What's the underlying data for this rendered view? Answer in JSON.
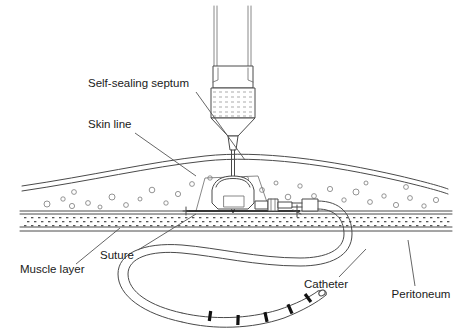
{
  "figure": {
    "background_color": "#ffffff",
    "line_color": "#4a4a4a",
    "text_color": "#1a1a1a",
    "width": 470,
    "height": 331
  },
  "labels": [
    {
      "id": "self-sealing-septum",
      "text": "Self-sealing septum",
      "x": 88,
      "y": 87,
      "anchor": "start",
      "leader": "M 196 92 L 245 160"
    },
    {
      "id": "skin-line",
      "text": "Skin line",
      "x": 88,
      "y": 128,
      "anchor": "start",
      "leader": "M 135 133 L 196 176"
    },
    {
      "id": "suture",
      "text": "Suture",
      "x": 100,
      "y": 259,
      "anchor": "start",
      "leader": "M 138 250 L 196 214"
    },
    {
      "id": "muscle-layer",
      "text": "Muscle layer",
      "x": 20,
      "y": 273,
      "anchor": "start",
      "leader": "M 76 264 L 120 228"
    },
    {
      "id": "catheter",
      "text": "Catheter",
      "x": 326,
      "y": 288,
      "anchor": "middle",
      "leader": "M 339 277 L 366 249"
    },
    {
      "id": "peritoneum",
      "text": "Peritoneum",
      "x": 421,
      "y": 298,
      "anchor": "middle",
      "leader": "M 415 286 L 408 240"
    }
  ],
  "components": [
    {
      "id": "syringe-barrel",
      "name": "syringe barrel"
    },
    {
      "id": "syringe-grip",
      "name": "syringe finger grip"
    },
    {
      "id": "syringe-hatched-chamber",
      "name": "hatched medication chamber"
    },
    {
      "id": "syringe-cone",
      "name": "syringe luer cone"
    },
    {
      "id": "needle-hub",
      "name": "non-coring needle hub"
    },
    {
      "id": "needle-shaft",
      "name": "non-coring needle shaft"
    },
    {
      "id": "skin-surface",
      "name": "skin surface line"
    },
    {
      "id": "subcutaneous-fat",
      "name": "subcutaneous fat layer"
    },
    {
      "id": "muscle-band",
      "name": "muscle layer band"
    },
    {
      "id": "peritoneum-line",
      "name": "peritoneum line"
    },
    {
      "id": "port-body",
      "name": "port reservoir body"
    },
    {
      "id": "port-septum",
      "name": "self-sealing septum"
    },
    {
      "id": "port-baseplate",
      "name": "port base plate"
    },
    {
      "id": "suture-anchor-left",
      "name": "left suture anchor"
    },
    {
      "id": "suture-anchor-right",
      "name": "right suture anchor"
    },
    {
      "id": "catheter-connector",
      "name": "catheter lock connector"
    },
    {
      "id": "catheter-sleeve",
      "name": "catheter strain relief sleeve"
    },
    {
      "id": "catheter-tube",
      "name": "catheter tubing s-curve"
    },
    {
      "id": "catheter-tip",
      "name": "catheter distal tip"
    },
    {
      "id": "catheter-markers",
      "name": "radiopaque marker bands"
    }
  ],
  "geometry": {
    "skin_top_curve": "M 22 186 C 90 176 150 162 205 156 C 260 150 330 160 400 176 C 425 182 440 186 448 189",
    "skin_inner_curve": "M 22 191 C 90 181 150 167 205 161 C 260 155 330 165 400 181 C 425 187 440 191 448 194",
    "fat_bottom_line": "M 20 211 L 452 211",
    "muscle_band_top": 214,
    "muscle_band_bottom": 227,
    "peritoneum_line_y": 231,
    "catheter_path": "M 314 213 C 336 213 348 222 348 236 C 348 254 330 262 300 262 C 255 262 215 252 180 249 C 145 246 122 254 122 272 C 122 292 146 308 180 316 C 210 323 250 322 284 312 C 306 305 322 296 330 291",
    "catheter_marker_count": 5
  },
  "fat_cells": [
    {
      "cx": 47,
      "cy": 204,
      "r": 3.0
    },
    {
      "cx": 63,
      "cy": 199,
      "r": 2.2
    },
    {
      "cx": 72,
      "cy": 206,
      "r": 2.6
    },
    {
      "cx": 88,
      "cy": 203,
      "r": 2.4
    },
    {
      "cx": 100,
      "cy": 207,
      "r": 2.0
    },
    {
      "cx": 74,
      "cy": 192,
      "r": 2.4
    },
    {
      "cx": 112,
      "cy": 197,
      "r": 3.0
    },
    {
      "cx": 126,
      "cy": 205,
      "r": 2.4
    },
    {
      "cx": 140,
      "cy": 199,
      "r": 2.0
    },
    {
      "cx": 152,
      "cy": 190,
      "r": 2.8
    },
    {
      "cx": 166,
      "cy": 203,
      "r": 2.2
    },
    {
      "cx": 178,
      "cy": 194,
      "r": 2.6
    },
    {
      "cx": 192,
      "cy": 184,
      "r": 2.4
    },
    {
      "cx": 210,
      "cy": 178,
      "r": 2.2
    },
    {
      "cx": 246,
      "cy": 179,
      "r": 2.6
    },
    {
      "cx": 262,
      "cy": 190,
      "r": 2.4
    },
    {
      "cx": 276,
      "cy": 183,
      "r": 2.0
    },
    {
      "cx": 288,
      "cy": 197,
      "r": 2.8
    },
    {
      "cx": 300,
      "cy": 186,
      "r": 2.2
    },
    {
      "cx": 314,
      "cy": 196,
      "r": 2.4
    },
    {
      "cx": 330,
      "cy": 189,
      "r": 2.6
    },
    {
      "cx": 344,
      "cy": 200,
      "r": 2.2
    },
    {
      "cx": 356,
      "cy": 192,
      "r": 3.0
    },
    {
      "cx": 370,
      "cy": 202,
      "r": 2.4
    },
    {
      "cx": 384,
      "cy": 196,
      "r": 2.2
    },
    {
      "cx": 396,
      "cy": 205,
      "r": 2.6
    },
    {
      "cx": 410,
      "cy": 198,
      "r": 2.4
    },
    {
      "cx": 424,
      "cy": 206,
      "r": 2.2
    },
    {
      "cx": 436,
      "cy": 200,
      "r": 2.6
    },
    {
      "cx": 366,
      "cy": 183,
      "r": 2.0
    },
    {
      "cx": 406,
      "cy": 187,
      "r": 2.4
    },
    {
      "cx": 232,
      "cy": 192,
      "r": 2.2
    }
  ]
}
